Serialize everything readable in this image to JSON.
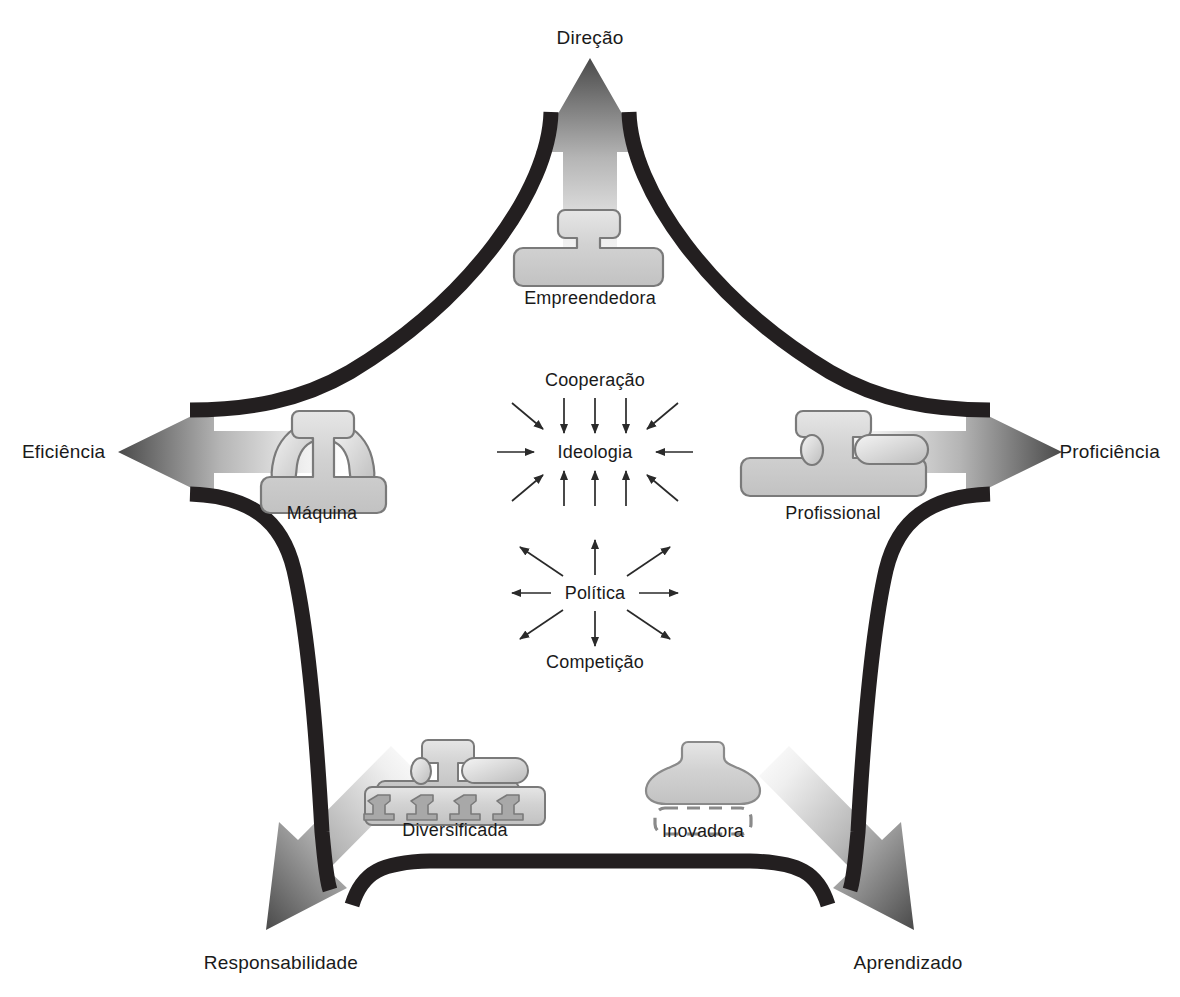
{
  "diagram": {
    "background_color": "#ffffff",
    "band_color": "#231f20",
    "arrow_gradient": {
      "light": "#f2f2f2",
      "mid": "#bdbdbd",
      "dark": "#4d4d4d"
    },
    "icon_fill": "#cfcfcf",
    "icon_stroke": "#6e6e6e",
    "text_color": "#1a1a1a"
  },
  "corner_labels": [
    {
      "id": "direcao",
      "text": "Direção",
      "position": "top",
      "arrow_direction": "up"
    },
    {
      "id": "eficiencia",
      "text": "Eficiência",
      "position": "left",
      "arrow_direction": "left"
    },
    {
      "id": "proficiencia",
      "text": "Proficiência",
      "position": "right",
      "arrow_direction": "right"
    },
    {
      "id": "responsabilidade",
      "text": "Responsabilidade",
      "position": "bottom-left",
      "arrow_direction": "down-left"
    },
    {
      "id": "aprendizado",
      "text": "Aprendizado",
      "position": "bottom-right",
      "arrow_direction": "down-right"
    }
  ],
  "configurations": [
    {
      "id": "empreendedora",
      "label": "Empreendedora",
      "corner": "direcao",
      "icon": "simple-structure-icon"
    },
    {
      "id": "maquina",
      "label": "Máquina",
      "corner": "eficiencia",
      "icon": "machine-bureaucracy-icon"
    },
    {
      "id": "profissional",
      "label": "Profissional",
      "corner": "proficiencia",
      "icon": "professional-bureaucracy-icon"
    },
    {
      "id": "diversificada",
      "label": "Diversificada",
      "corner": "responsabilidade",
      "icon": "divisionalized-form-icon"
    },
    {
      "id": "inovadora",
      "label": "Inovadora",
      "corner": "aprendizado",
      "icon": "adhocracy-icon"
    }
  ],
  "center": {
    "converging": {
      "hub": "Ideologia",
      "top_label": "Cooperação",
      "arrow_direction": "inward",
      "arrow_count": 12
    },
    "diverging": {
      "hub": "Política",
      "bottom_label": "Competição",
      "arrow_direction": "outward",
      "arrow_count": 8
    }
  }
}
